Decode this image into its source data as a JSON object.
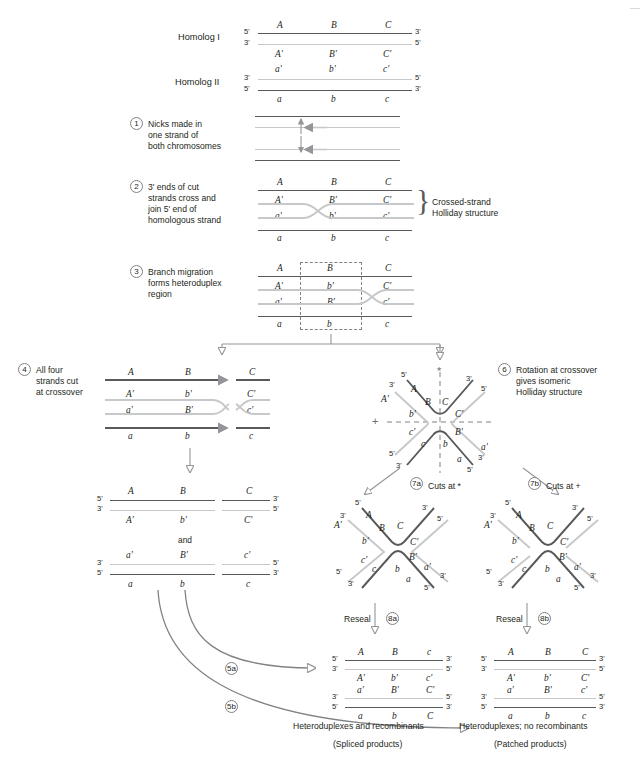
{
  "figure": {
    "title_markers": [
      "A",
      "B",
      "C",
      "A'",
      "B'",
      "C'",
      "a'",
      "b'",
      "c'",
      "a",
      "b",
      "c"
    ],
    "homolog1_label": "Homolog I",
    "homolog2_label": "Homolog II",
    "five_prime": "5'",
    "three_prime": "3'"
  },
  "steps": [
    {
      "num": "1",
      "text": "Nicks made in\none strand of\nboth chromosomes"
    },
    {
      "num": "2",
      "text": "3' ends of cut\nstrands cross and\njoin 5' end of\nhomologous strand"
    },
    {
      "num": "3",
      "text": "Branch migration\nforms heteroduplex\nregion"
    },
    {
      "num": "4",
      "text": "All four\nstrands cut\nat crossover"
    },
    {
      "num": "6",
      "text": "Rotation at crossover\ngives isomeric\nHolliday structure"
    }
  ],
  "step_labels": {
    "s1": "1",
    "s2": "2",
    "s3": "3",
    "s4": "4",
    "s5a": "5a",
    "s5b": "5b",
    "s6": "6",
    "s7a": "7a",
    "s7b": "7b",
    "s8a": "8a",
    "s8b": "8b"
  },
  "step1_text_lines": [
    "Nicks made in",
    "one strand of",
    "both chromosomes"
  ],
  "step2_text_lines": [
    "3' ends of cut",
    "strands cross and",
    "join 5' end of",
    "homologous strand"
  ],
  "step3_text_lines": [
    "Branch migration",
    "forms heteroduplex",
    "region"
  ],
  "step4_text_lines": [
    "All four",
    "strands cut",
    "at crossover"
  ],
  "step6_text_lines": [
    "Rotation at crossover",
    "gives isomeric",
    "Holliday structure"
  ],
  "annotations": {
    "crossed_strand_l1": "Crossed-strand",
    "crossed_strand_l2": "Holliday structure",
    "cuts_at_star": "Cuts at *",
    "cuts_at_plus": "Cuts at +",
    "reseal_a": "Reseal",
    "reseal_b": "Reseal",
    "and": "and",
    "star": "*",
    "plus": "+"
  },
  "bottom_captions": {
    "left_line1": "Heteroduplexes and recombinants",
    "left_line2": "(Spliced products)",
    "right_line1": "Heteroduplexes; no recombinants",
    "right_line2": "(Patched products)"
  },
  "panel_top": {
    "h1_top_markers": [
      "A",
      "B",
      "C"
    ],
    "h1_bottom_markers": [
      "A'",
      "B'",
      "C'"
    ],
    "h2_top_markers": [
      "a'",
      "b'",
      "c'"
    ],
    "h2_bottom_markers": [
      "a",
      "b",
      "c"
    ],
    "h1_left_ends": [
      "5'",
      "3'"
    ],
    "h1_right_ends": [
      "3'",
      "5'"
    ],
    "h2_left_ends": [
      "3'",
      "5'"
    ],
    "h2_right_ends": [
      "5'",
      "3'"
    ]
  },
  "panel_step2": {
    "top": [
      "A",
      "B",
      "C"
    ],
    "upper_inner": [
      "A'",
      "B'",
      "C'"
    ],
    "lower_inner": [
      "a'",
      "b'",
      "c'"
    ],
    "bottom": [
      "a",
      "b",
      "c"
    ]
  },
  "panel_step3": {
    "top": [
      "A",
      "B",
      "C"
    ],
    "upper_inner": [
      "A'",
      "b'",
      "C'"
    ],
    "lower_inner": [
      "a'",
      "B'",
      "c'"
    ],
    "bottom": [
      "a",
      "b",
      "c"
    ]
  },
  "panel_step4": {
    "top": [
      "A",
      "B",
      "C"
    ],
    "upper_inner": [
      "A'",
      "b'",
      "C'"
    ],
    "lower_inner": [
      "a'",
      "B'",
      "c'"
    ],
    "bottom": [
      "a",
      "b",
      "c"
    ]
  },
  "panel_step4_products": {
    "p1_top": [
      "A",
      "B",
      "C"
    ],
    "p1_bottom": [
      "A'",
      "b'",
      "C'"
    ],
    "p1_left_ends": [
      "5'",
      "3'"
    ],
    "p1_right_ends": [
      "3'",
      "5'"
    ],
    "p2_top": [
      "a'",
      "B'",
      "c'"
    ],
    "p2_bottom": [
      "a",
      "b",
      "c"
    ],
    "p2_left_ends": [
      "3'",
      "5'"
    ],
    "p2_right_ends": [
      "5'",
      "3'"
    ]
  },
  "panel_holliday_x": {
    "arms": [
      "A",
      "B",
      "C",
      "A'",
      "b'",
      "C'",
      "c'",
      "B'",
      "a'",
      "c",
      "b",
      "a"
    ],
    "ends_top_left": [
      "5'",
      "3'"
    ],
    "ends_top_right": [
      "3'",
      "5'"
    ],
    "ends_bottom_left": [
      "5'",
      "3'"
    ],
    "ends_bottom_right": [
      "3'",
      "5'"
    ]
  },
  "panel_7a": {
    "arms": [
      "A",
      "B",
      "C",
      "A'",
      "b'",
      "C'",
      "c'",
      "B'",
      "a'",
      "c",
      "b",
      "a"
    ],
    "ends": [
      "5'",
      "3'",
      "3'",
      "5'",
      "5'",
      "3'",
      "3'",
      "5'"
    ]
  },
  "panel_7b": {
    "arms": [
      "A",
      "B",
      "C",
      "A'",
      "b'",
      "C'",
      "c'",
      "B'",
      "a'",
      "c",
      "b",
      "a"
    ],
    "ends": [
      "5'",
      "3'",
      "3'",
      "5'",
      "5'",
      "3'",
      "3'",
      "5'"
    ]
  },
  "panel_8a": {
    "d1_top": [
      "A",
      "B",
      "c"
    ],
    "d1_inner": [
      "A'",
      "b'",
      "c'"
    ],
    "d2_inner": [
      "a'",
      "B'",
      "C'"
    ],
    "d2_bottom": [
      "a",
      "b",
      "C"
    ],
    "d1_left_ends": [
      "5'",
      "3'"
    ],
    "d1_right_ends": [
      "3'",
      "5'"
    ],
    "d2_left_ends": [
      "3'",
      "5'"
    ],
    "d2_right_ends": [
      "5'",
      "3'"
    ]
  },
  "panel_8b": {
    "d1_top": [
      "A",
      "B",
      "C"
    ],
    "d1_inner": [
      "A'",
      "b'",
      "C'"
    ],
    "d2_inner": [
      "a'",
      "B'",
      "c'"
    ],
    "d2_bottom": [
      "a",
      "b",
      "c"
    ],
    "d1_left_ends": [
      "5'",
      "3'"
    ],
    "d1_right_ends": [
      "3'",
      "5'"
    ],
    "d2_left_ends": [
      "3'",
      "5'"
    ],
    "d2_right_ends": [
      "5'",
      "3'"
    ]
  },
  "colors": {
    "dark_strand": "#58595b",
    "light_strand": "#c7c8ca",
    "text": "#231f20",
    "arrow": "#939598",
    "dashed": "#808285"
  }
}
